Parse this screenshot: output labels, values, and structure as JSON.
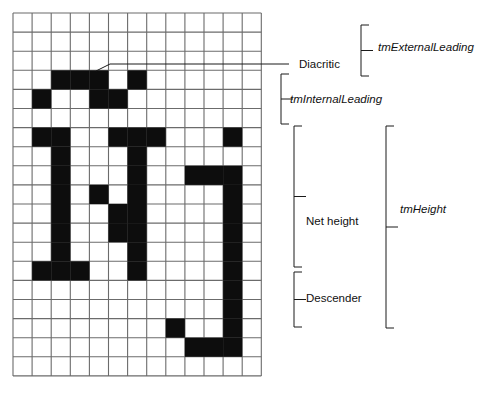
{
  "diagram": {
    "grid": {
      "origin_x": 13,
      "origin_y": 13,
      "cell": 19.1,
      "cols": 13,
      "rows": 19,
      "line_color": "#6b6b6b",
      "fill_color": "#0d0d0d",
      "background": "#ffffff"
    },
    "glyph_name": "diacritic-n-j-bitmap",
    "glyph_cells": [
      [
        2,
        3
      ],
      [
        3,
        3
      ],
      [
        4,
        3
      ],
      [
        6,
        3
      ],
      [
        1,
        4
      ],
      [
        4,
        4
      ],
      [
        5,
        4
      ],
      [
        1,
        6
      ],
      [
        2,
        6
      ],
      [
        5,
        6
      ],
      [
        6,
        6
      ],
      [
        7,
        6
      ],
      [
        11,
        6
      ],
      [
        2,
        7
      ],
      [
        6,
        7
      ],
      [
        2,
        8
      ],
      [
        6,
        8
      ],
      [
        9,
        8
      ],
      [
        10,
        8
      ],
      [
        11,
        8
      ],
      [
        2,
        9
      ],
      [
        4,
        9
      ],
      [
        6,
        9
      ],
      [
        11,
        9
      ],
      [
        2,
        10
      ],
      [
        5,
        10
      ],
      [
        6,
        10
      ],
      [
        11,
        10
      ],
      [
        2,
        11
      ],
      [
        5,
        11
      ],
      [
        6,
        11
      ],
      [
        11,
        11
      ],
      [
        2,
        12
      ],
      [
        6,
        12
      ],
      [
        11,
        12
      ],
      [
        1,
        13
      ],
      [
        2,
        13
      ],
      [
        3,
        13
      ],
      [
        6,
        13
      ],
      [
        11,
        13
      ],
      [
        11,
        14
      ],
      [
        11,
        15
      ],
      [
        8,
        16
      ],
      [
        11,
        16
      ],
      [
        9,
        17
      ],
      [
        10,
        17
      ],
      [
        11,
        17
      ]
    ],
    "leader": {
      "name": "diacritic-leader-line",
      "from_x": 96,
      "from_y": 71,
      "elbow_x": 110,
      "elbow_y": 64,
      "to_x": 289,
      "to_y": 64
    },
    "labels": [
      {
        "id": "diacritic",
        "text": "Diacritic",
        "italic": false,
        "x": 299,
        "y": 58,
        "two_line": false
      },
      {
        "id": "tm-internal-leading",
        "text": "tmInternalLeading",
        "italic": true,
        "x": 290,
        "y": 93,
        "two_line": false
      },
      {
        "id": "tm-external-leading",
        "text": "tmExternalLeading",
        "italic": true,
        "x": 378,
        "y": 41,
        "two_line": false
      },
      {
        "id": "net-height",
        "text": "Net height",
        "italic": false,
        "x": 306,
        "y": 215,
        "two_line": true
      },
      {
        "id": "descender",
        "text": "Descender",
        "italic": false,
        "x": 306,
        "y": 292,
        "two_line": false
      },
      {
        "id": "tm-height",
        "text": "tmHeight",
        "italic": true,
        "x": 400,
        "y": 203,
        "two_line": false
      }
    ],
    "brackets": [
      {
        "id": "tm-internal-leading-bracket",
        "x": 281,
        "top": 74,
        "bottom": 124,
        "tick_dir": "right",
        "arm": 8
      },
      {
        "id": "tm-external-leading-bracket",
        "x": 361,
        "top": 25,
        "bottom": 76,
        "tick_dir": "right",
        "arm": 8
      },
      {
        "id": "net-height-bracket",
        "x": 294,
        "top": 126,
        "bottom": 267,
        "tick_dir": "right",
        "arm": 8
      },
      {
        "id": "descender-bracket",
        "x": 294,
        "top": 272,
        "bottom": 327,
        "tick_dir": "right",
        "arm": 8
      },
      {
        "id": "tm-height-bracket",
        "x": 386,
        "top": 126,
        "bottom": 328,
        "tick_dir": "right",
        "arm": 8
      }
    ],
    "colors": {
      "stroke": "#1a1a1a",
      "grid_line": "#6b6b6b",
      "ink": "#0d0d0d",
      "text": "#111111"
    }
  }
}
